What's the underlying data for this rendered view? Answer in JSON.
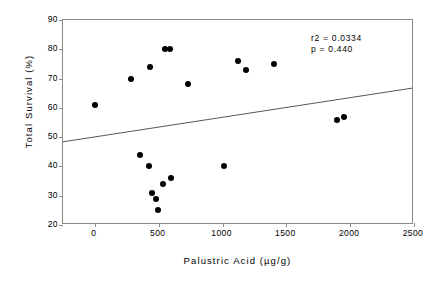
{
  "chart_data": {
    "type": "scatter",
    "title": "",
    "xlabel": "Palustric Acid (µg/g)",
    "ylabel": "Total Survival (%)",
    "xlim": [
      -250,
      2500
    ],
    "ylim": [
      20,
      90
    ],
    "xticks": [
      0,
      500,
      1000,
      1500,
      2000,
      2500
    ],
    "yticks": [
      20,
      30,
      40,
      50,
      60,
      70,
      80,
      90
    ],
    "xtick_labels": [
      "0",
      "500",
      "1000",
      "1500",
      "2000",
      "2500"
    ],
    "ytick_labels": [
      "20",
      "30",
      "40",
      "50",
      "60",
      "70",
      "80",
      "90"
    ],
    "grid": false,
    "legend": null,
    "marker": "filled-circle",
    "marker_color": "#000000",
    "points": [
      {
        "x": 0,
        "y": 61
      },
      {
        "x": 285,
        "y": 70
      },
      {
        "x": 350,
        "y": 44
      },
      {
        "x": 420,
        "y": 40
      },
      {
        "x": 430,
        "y": 74
      },
      {
        "x": 450,
        "y": 31
      },
      {
        "x": 480,
        "y": 29
      },
      {
        "x": 495,
        "y": 25
      },
      {
        "x": 530,
        "y": 34
      },
      {
        "x": 550,
        "y": 80
      },
      {
        "x": 585,
        "y": 80
      },
      {
        "x": 600,
        "y": 36
      },
      {
        "x": 730,
        "y": 68
      },
      {
        "x": 1010,
        "y": 40
      },
      {
        "x": 1120,
        "y": 76
      },
      {
        "x": 1180,
        "y": 73
      },
      {
        "x": 1400,
        "y": 75
      },
      {
        "x": 1895,
        "y": 56
      },
      {
        "x": 1950,
        "y": 57
      }
    ],
    "trendline": {
      "type": "linear-regression",
      "x_start": -250,
      "y_start": 48,
      "x_end": 2500,
      "y_end": 66.5,
      "color": "#555555"
    },
    "annotations": {
      "r_squared": "r2 = 0.0334",
      "p_value": "p = 0.440"
    }
  },
  "colors": {
    "axis": "#8a8a8a",
    "marker": "#000000",
    "trendline": "#555555",
    "text": "#000000",
    "background": "#ffffff"
  }
}
